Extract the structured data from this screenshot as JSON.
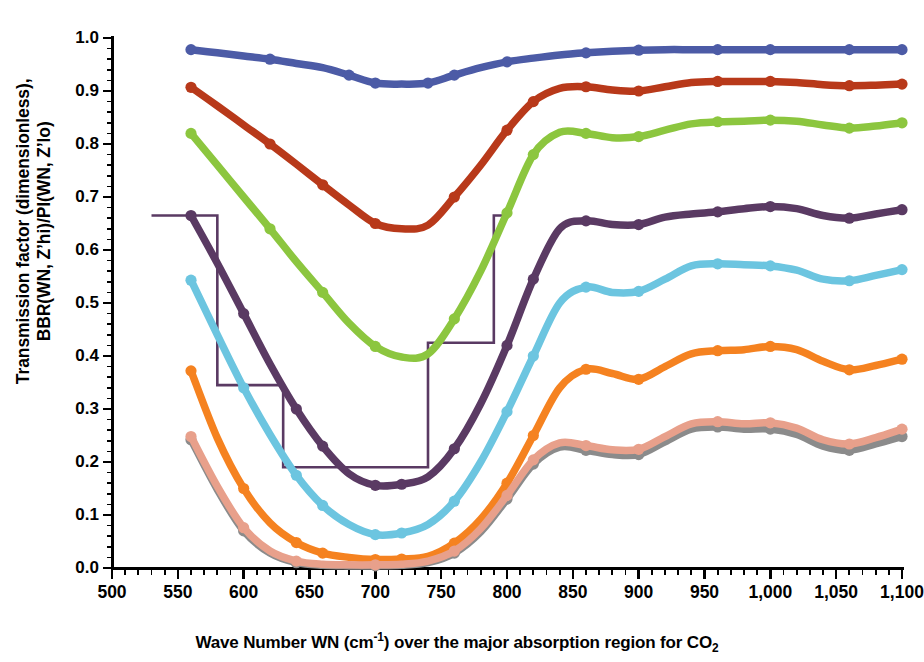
{
  "titles": {
    "top_partial": "CO₂ ... Z'hi ... PI ... approximation",
    "ylabel_line1": "Transmission factor (dimensionless),",
    "ylabel_line2": "BBR(WN, Z’hi)/PI(WN, Z’lo)",
    "xlabel_pre": "Wave Number WN (cm",
    "xlabel_sup": "-1",
    "xlabel_mid": ") over the major absorption region for CO",
    "xlabel_sub": "2"
  },
  "axes": {
    "x_ticks": [
      "500",
      "550",
      "600",
      "650",
      "700",
      "750",
      "800",
      "850",
      "900",
      "950",
      "1,000",
      "1,050",
      "1,100"
    ],
    "x_tick_values": [
      500,
      550,
      600,
      650,
      700,
      750,
      800,
      850,
      900,
      950,
      1000,
      1050,
      1100
    ],
    "y_ticks": [
      "0.0",
      "0.1",
      "0.2",
      "0.3",
      "0.4",
      "0.5",
      "0.6",
      "0.7",
      "0.8",
      "0.9",
      "1.0"
    ],
    "y_tick_values": [
      0.0,
      0.1,
      0.2,
      0.3,
      0.4,
      0.5,
      0.6,
      0.7,
      0.8,
      0.9,
      1.0
    ],
    "xlim": [
      500,
      1100
    ],
    "ylim": [
      0.0,
      1.0
    ],
    "x_minor_per_major": 5,
    "y_minor_per_major": 5,
    "grid": false,
    "legend": "none"
  },
  "colors": {
    "series_1_blue": "#4c5ba6",
    "series_2_brick": "#b8391a",
    "series_3_green": "#8cc63f",
    "series_4_purple": "#5a3a63",
    "series_5_lightblue": "#6cc5e0",
    "series_6_orange": "#f58220",
    "series_7_gray": "#8b8b8b",
    "series_8_salmon": "#e8a08b",
    "step_purple": "#5a3a63",
    "axis_black": "#000000",
    "background": "#ffffff"
  },
  "chart_data": {
    "type": "line",
    "xlabel": "Wave Number WN (cm-1) over the major absorption region for CO2",
    "ylabel": "Transmission factor (dimensionless), BBR(WN, Z'hi)/PI(WN, Z'lo)",
    "xlim": [
      500,
      1100
    ],
    "ylim": [
      0.0,
      1.0
    ],
    "grid": false,
    "legend_position": "none",
    "x": [
      560,
      580,
      600,
      620,
      640,
      660,
      680,
      700,
      720,
      740,
      760,
      780,
      800,
      820,
      840,
      860,
      880,
      900,
      920,
      940,
      960,
      980,
      1000,
      1020,
      1040,
      1060,
      1080,
      1100
    ],
    "series": [
      {
        "name": "series-1-blue",
        "color": "#4c5ba6",
        "marker_x": [
          560,
          620,
          680,
          700,
          740,
          760,
          800,
          860,
          900,
          960,
          1000,
          1060,
          1100
        ],
        "values": [
          0.978,
          0.972,
          0.966,
          0.96,
          0.952,
          0.944,
          0.93,
          0.915,
          0.913,
          0.915,
          0.93,
          0.944,
          0.955,
          0.962,
          0.968,
          0.972,
          0.975,
          0.977,
          0.978,
          0.978,
          0.978,
          0.978,
          0.978,
          0.978,
          0.978,
          0.978,
          0.978,
          0.978
        ]
      },
      {
        "name": "series-2-brick",
        "color": "#b8391a",
        "marker_x": [
          560,
          620,
          660,
          700,
          760,
          800,
          820,
          860,
          900,
          960,
          1000,
          1060,
          1100
        ],
        "values": [
          0.907,
          0.872,
          0.836,
          0.8,
          0.762,
          0.723,
          0.685,
          0.65,
          0.64,
          0.647,
          0.7,
          0.76,
          0.826,
          0.88,
          0.905,
          0.908,
          0.902,
          0.9,
          0.908,
          0.916,
          0.918,
          0.918,
          0.918,
          0.916,
          0.912,
          0.91,
          0.911,
          0.913
        ]
      },
      {
        "name": "series-3-green",
        "color": "#8cc63f",
        "marker_x": [
          560,
          620,
          660,
          700,
          760,
          800,
          820,
          860,
          900,
          960,
          1000,
          1060,
          1100
        ],
        "values": [
          0.82,
          0.76,
          0.7,
          0.64,
          0.578,
          0.52,
          0.462,
          0.418,
          0.398,
          0.404,
          0.47,
          0.56,
          0.67,
          0.78,
          0.822,
          0.82,
          0.812,
          0.814,
          0.826,
          0.838,
          0.842,
          0.843,
          0.845,
          0.843,
          0.836,
          0.83,
          0.834,
          0.84
        ]
      },
      {
        "name": "series-4-purple",
        "color": "#5a3a63",
        "marker_x": [
          560,
          600,
          640,
          660,
          700,
          720,
          760,
          800,
          820,
          860,
          900,
          960,
          1000,
          1060,
          1100
        ],
        "values": [
          0.665,
          0.575,
          0.48,
          0.385,
          0.3,
          0.23,
          0.178,
          0.156,
          0.158,
          0.172,
          0.225,
          0.31,
          0.42,
          0.545,
          0.64,
          0.655,
          0.648,
          0.648,
          0.662,
          0.668,
          0.672,
          0.678,
          0.682,
          0.678,
          0.665,
          0.66,
          0.668,
          0.676
        ]
      },
      {
        "name": "series-5-lightblue",
        "color": "#6cc5e0",
        "marker_x": [
          560,
          600,
          640,
          660,
          700,
          720,
          760,
          800,
          820,
          860,
          900,
          960,
          1000,
          1060,
          1100
        ],
        "values": [
          0.543,
          0.44,
          0.34,
          0.252,
          0.175,
          0.118,
          0.082,
          0.063,
          0.066,
          0.082,
          0.126,
          0.2,
          0.295,
          0.4,
          0.5,
          0.53,
          0.52,
          0.522,
          0.545,
          0.57,
          0.574,
          0.572,
          0.57,
          0.562,
          0.545,
          0.542,
          0.552,
          0.563
        ]
      },
      {
        "name": "series-6-orange",
        "color": "#f58220",
        "marker_x": [
          560,
          600,
          640,
          660,
          700,
          720,
          760,
          800,
          820,
          860,
          900,
          960,
          1000,
          1060,
          1100
        ],
        "values": [
          0.372,
          0.245,
          0.15,
          0.085,
          0.048,
          0.028,
          0.02,
          0.016,
          0.017,
          0.022,
          0.047,
          0.092,
          0.16,
          0.25,
          0.34,
          0.375,
          0.367,
          0.356,
          0.38,
          0.404,
          0.41,
          0.412,
          0.418,
          0.412,
          0.39,
          0.374,
          0.382,
          0.394
        ]
      },
      {
        "name": "series-7-gray",
        "color": "#8b8b8b",
        "marker_x": [
          560,
          600,
          640,
          700,
          760,
          800,
          820,
          860,
          900,
          960,
          1000,
          1060,
          1100
        ],
        "values": [
          0.242,
          0.148,
          0.07,
          0.028,
          0.01,
          0.005,
          0.004,
          0.004,
          0.005,
          0.01,
          0.028,
          0.068,
          0.13,
          0.196,
          0.228,
          0.222,
          0.214,
          0.214,
          0.238,
          0.262,
          0.266,
          0.262,
          0.262,
          0.252,
          0.23,
          0.222,
          0.234,
          0.248
        ]
      },
      {
        "name": "series-8-salmon",
        "color": "#e8a08b",
        "marker_x": [
          560,
          600,
          640,
          700,
          760,
          800,
          820,
          860,
          900,
          960,
          1000,
          1060,
          1100
        ],
        "values": [
          0.248,
          0.154,
          0.076,
          0.032,
          0.013,
          0.007,
          0.006,
          0.006,
          0.007,
          0.013,
          0.032,
          0.074,
          0.137,
          0.204,
          0.236,
          0.231,
          0.223,
          0.224,
          0.248,
          0.272,
          0.276,
          0.272,
          0.274,
          0.264,
          0.242,
          0.234,
          0.246,
          0.262
        ]
      }
    ],
    "step_series": {
      "name": "step-approximation-purple",
      "color": "#5a3a63",
      "style": "thin-staircase",
      "steps": [
        {
          "x_start": 530,
          "x_end": 580,
          "level": 0.665
        },
        {
          "x_start": 580,
          "x_end": 630,
          "level": 0.345
        },
        {
          "x_start": 630,
          "x_end": 740,
          "level": 0.19
        },
        {
          "x_start": 740,
          "x_end": 790,
          "level": 0.425
        },
        {
          "x_start": 790,
          "x_end": 800,
          "level": 0.665
        }
      ]
    }
  }
}
